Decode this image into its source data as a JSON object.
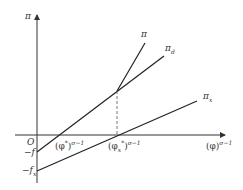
{
  "diagram": {
    "axes": {
      "y_label": "π",
      "x_label_base": "(φ)",
      "x_label_exp": "σ−1",
      "origin_label": "O"
    },
    "intercepts": {
      "f_label_prefix": "−",
      "f_label": "f",
      "fs_label_prefix": "−",
      "fs_label": "f",
      "fs_sub": "x"
    },
    "x_ticks": [
      {
        "base": "(φ",
        "sup_inner": "*",
        "close": ")",
        "exp": "σ−1"
      },
      {
        "base": "(φ",
        "sub_inner": "x",
        "sup_inner": "*",
        "close": ")",
        "exp": "σ−1"
      }
    ],
    "lines": [
      {
        "name": "π",
        "label": "π",
        "sub": ""
      },
      {
        "name": "π_d",
        "label": "π",
        "sub": "d"
      },
      {
        "name": "π_x",
        "label": "π",
        "sub": "x"
      }
    ],
    "colors": {
      "line": "#222222",
      "axis": "#333333",
      "dash": "#555555"
    }
  }
}
